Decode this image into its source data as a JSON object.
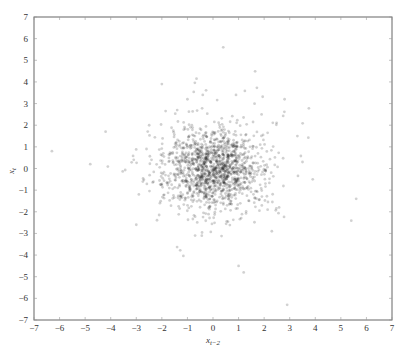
{
  "chart_data": {
    "type": "scatter",
    "title": "",
    "xlabel": "x_{t-2}",
    "ylabel": "x_t",
    "xlim": [
      -7,
      7
    ],
    "ylim": [
      -7,
      7
    ],
    "xticks": [
      -7,
      -6,
      -5,
      -4,
      -3,
      -2,
      -1,
      0,
      1,
      2,
      3,
      4,
      5,
      6,
      7
    ],
    "yticks": [
      -7,
      -6,
      -5,
      -4,
      -3,
      -2,
      -1,
      0,
      1,
      2,
      3,
      4,
      5,
      6,
      7
    ],
    "xtick_labels": [
      "−7",
      "−6",
      "−5",
      "−4",
      "−3",
      "−2",
      "−1",
      "0",
      "1",
      "2",
      "3",
      "4",
      "5",
      "6",
      "7"
    ],
    "ytick_labels": [
      "−7",
      "−6",
      "−5",
      "−4",
      "−3",
      "−2",
      "−1",
      "0",
      "1",
      "2",
      "3",
      "4",
      "5",
      "6",
      "7"
    ],
    "grid": false,
    "legend": null,
    "marker": {
      "color": "#000000",
      "opacity": 0.18,
      "radius": 1.4
    },
    "cluster": {
      "n": 1400,
      "mean": [
        0,
        0
      ],
      "std": [
        0.9,
        0.9
      ],
      "seed": 7
    },
    "outliers": [
      [
        0.4,
        5.6
      ],
      [
        -6.3,
        0.8
      ],
      [
        -4.8,
        0.2
      ],
      [
        -4.2,
        1.7
      ],
      [
        -3.1,
        0.4
      ],
      [
        -2.0,
        3.9
      ],
      [
        -1.4,
        2.7
      ],
      [
        -1.0,
        3.2
      ],
      [
        -0.4,
        3.4
      ],
      [
        0.9,
        3.4
      ],
      [
        2.8,
        3.2
      ],
      [
        3.3,
        1.5
      ],
      [
        3.9,
        -0.5
      ],
      [
        5.6,
        -1.4
      ],
      [
        1.0,
        -4.5
      ],
      [
        1.2,
        -4.8
      ],
      [
        2.9,
        -6.3
      ],
      [
        -3.0,
        -2.6
      ],
      [
        -2.6,
        0.9
      ],
      [
        -0.7,
        -3.1
      ],
      [
        2.3,
        -2.9
      ],
      [
        3.5,
        0.3
      ],
      [
        -2.9,
        -1.2
      ],
      [
        1.9,
        2.5
      ]
    ]
  }
}
